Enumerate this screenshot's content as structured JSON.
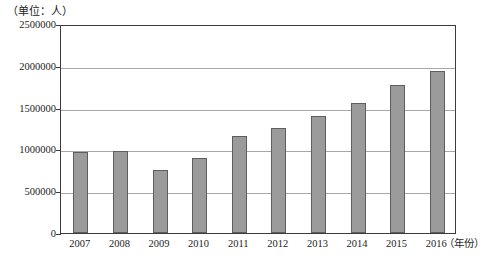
{
  "chart_data": {
    "type": "bar",
    "title": "",
    "subtitle": "",
    "unit_label": "（单位：人）",
    "xlabel": "（年份）",
    "ylabel": "",
    "categories": [
      "2007",
      "2008",
      "2009",
      "2010",
      "2011",
      "2012",
      "2013",
      "2014",
      "2015",
      "2016"
    ],
    "values": [
      970000,
      985000,
      750000,
      900000,
      1160000,
      1255000,
      1400000,
      1550000,
      1765000,
      1935000
    ],
    "ylim": [
      0,
      2500000
    ],
    "ytick_values": [
      0,
      500000,
      1000000,
      1500000,
      2000000,
      2500000
    ],
    "ytick_labels": [
      "0",
      "500000",
      "1000000",
      "1500000",
      "2000000",
      "2500000"
    ],
    "grid": true,
    "grid_axis": "y",
    "legend": null,
    "series": [
      {
        "name": "人数",
        "values": [
          970000,
          985000,
          750000,
          900000,
          1160000,
          1255000,
          1400000,
          1550000,
          1765000,
          1935000
        ]
      }
    ],
    "bar_color": "#9b9b9b",
    "bar_edge_color": "#5e5e5e",
    "axis_color": "#3c3c3c",
    "grid_color": "#a8a8a8",
    "background_color": "#ffffff"
  }
}
